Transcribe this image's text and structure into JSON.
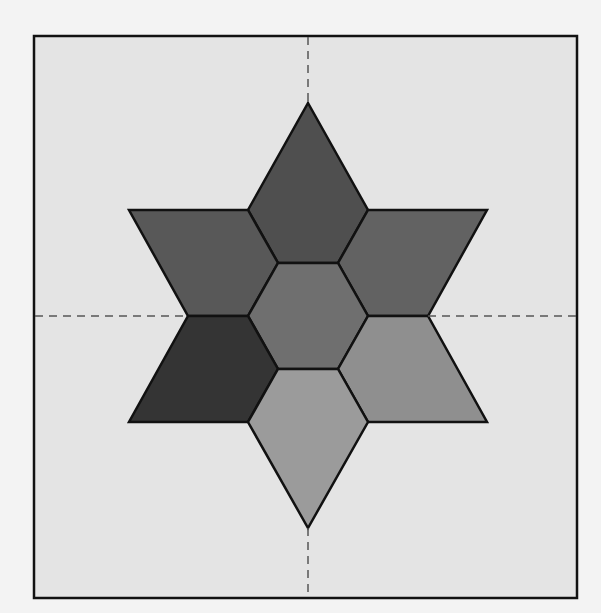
{
  "diagram": {
    "canvas": {
      "width": 601,
      "height": 613,
      "outside_color": "#f3f3f3"
    },
    "frame": {
      "x": 34,
      "y": 36,
      "width": 543,
      "height": 562,
      "fill": "#e4e4e4",
      "stroke": "#111111",
      "stroke_width": 2.5
    },
    "axes": {
      "color": "#555555",
      "dash": "8 6",
      "vertical": {
        "x": 308,
        "y1": 37,
        "y2": 597
      },
      "horizontal": {
        "y": 316,
        "x1": 35,
        "x2": 576
      }
    },
    "pieces": [
      {
        "name": "top-diamond",
        "fill": "#4f4f4f",
        "points": "308,103 368,210 338,263 278,263 248,210"
      },
      {
        "name": "upper-left-parallelogram",
        "fill": "#585858",
        "points": "129,210 248,210 278,263 248,316 188,316"
      },
      {
        "name": "upper-right-parallelogram",
        "fill": "#626262",
        "points": "368,210 487,210 428,316 368,316 338,263"
      },
      {
        "name": "center-hexagon",
        "fill": "#6f6f6f",
        "points": "278,263 338,263 368,316 338,369 278,369 248,316"
      },
      {
        "name": "lower-left-parallelogram",
        "fill": "#343434",
        "points": "188,316 248,316 278,369 248,422 129,422"
      },
      {
        "name": "lower-right-parallelogram",
        "fill": "#8f8f8f",
        "points": "368,316 428,316 487,422 368,422 338,369"
      },
      {
        "name": "bottom-diamond",
        "fill": "#9b9b9b",
        "points": "278,369 338,369 368,422 308,528 248,422"
      }
    ],
    "piece_stroke": "#111111",
    "piece_stroke_width": 2.5
  }
}
